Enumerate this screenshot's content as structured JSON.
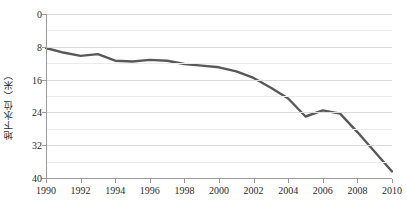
{
  "chart_data": {
    "type": "line",
    "title": "",
    "xlabel": "",
    "ylabel": "地下水位（米）",
    "x": [
      1990,
      1991,
      1992,
      1993,
      1994,
      1995,
      1996,
      1997,
      1998,
      1999,
      2000,
      2001,
      2002,
      2003,
      2004,
      2005,
      2006,
      2007,
      2008,
      2009,
      2010
    ],
    "xlim": [
      1990,
      2010
    ],
    "ylim": [
      0,
      40
    ],
    "y_inverted": true,
    "yticks": [
      0,
      8,
      16,
      24,
      32,
      40
    ],
    "ytick_labels": [
      "0",
      "8",
      "16",
      "24",
      "32",
      "40"
    ],
    "xticks": [
      1990,
      1992,
      1994,
      1996,
      1998,
      2000,
      2002,
      2004,
      2006,
      2008,
      2010
    ],
    "xtick_labels": [
      "1990",
      "1992",
      "1994",
      "1996",
      "1998",
      "2000",
      "2002",
      "2004",
      "2006",
      "2008",
      "2010"
    ],
    "minor_gridlines_y": [
      4,
      12,
      20,
      28,
      36
    ],
    "grid": true,
    "legend": false,
    "series": [
      {
        "name": "地下水位",
        "color": "#595959",
        "line_width": 2.4,
        "values": [
          8.3,
          9.4,
          10.2,
          9.8,
          11.4,
          11.6,
          11.2,
          11.4,
          12.2,
          12.6,
          13.0,
          14.0,
          15.6,
          18.0,
          20.6,
          25.0,
          23.5,
          24.3,
          28.8,
          33.6,
          38.4
        ]
      }
    ]
  },
  "axis": {
    "y_title": "地下水位（米）"
  }
}
